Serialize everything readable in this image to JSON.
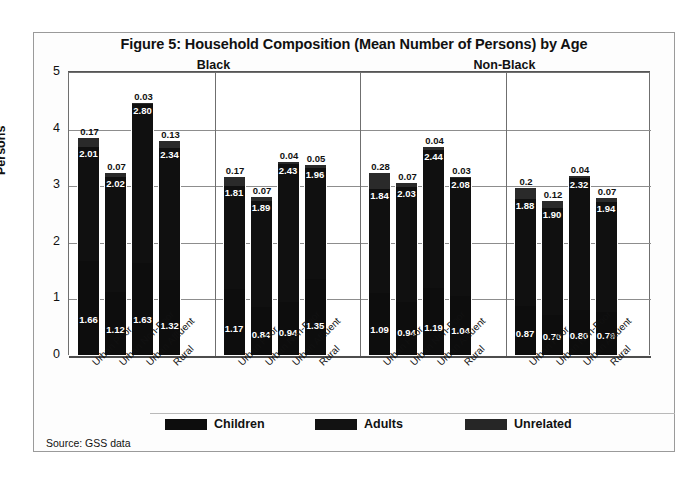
{
  "figure": {
    "title": "Figure 5: Household Composition (Mean Number of Persons) by Age",
    "source": "Source:  GSS data"
  },
  "axis": {
    "ylabel": "Persons",
    "yticks": [
      "0",
      "1",
      "2",
      "3",
      "4",
      "5"
    ],
    "ymin": 0,
    "ymax": 5
  },
  "legend": {
    "items": [
      {
        "label": "Children",
        "color": "#0d0d0d",
        "icon": "legend-swatch-icon"
      },
      {
        "label": "Adults",
        "color": "#121212",
        "icon": "legend-swatch-icon"
      },
      {
        "label": "Unrelated",
        "color": "#262626",
        "icon": "legend-swatch-icon"
      }
    ]
  },
  "superheaders": [
    {
      "label": "Black"
    },
    {
      "label": "Non-Black"
    }
  ],
  "panels": [
    {
      "label": "1970s"
    },
    {
      "label": "1980s"
    },
    {
      "label": "1970s"
    },
    {
      "label": "1980s"
    }
  ],
  "categories": [
    "Urban Poor",
    "Urban Non-Poor",
    "Urban Affluent",
    "Rural"
  ],
  "chart_data": {
    "type": "bar",
    "title": "Figure 5: Household Composition (Mean Number of Persons) by Age",
    "xlabel": "",
    "ylabel": "Persons",
    "ylim": [
      0,
      5
    ],
    "grid": true,
    "stacked": true,
    "legend_position": "bottom",
    "categories": [
      "Urban Poor",
      "Urban Non-Poor",
      "Urban Affluent",
      "Rural"
    ],
    "series": [
      {
        "name": "Children",
        "color": "#0d0d0d"
      },
      {
        "name": "Adults",
        "color": "#121212"
      },
      {
        "name": "Unrelated",
        "color": "#262626"
      }
    ],
    "groups": [
      {
        "race": "Black",
        "decade": "1970s",
        "bars": [
          {
            "category": "Urban Poor",
            "children": 1.66,
            "adults": 2.01,
            "unrelated": 0.17,
            "total": 3.84
          },
          {
            "category": "Urban Non-Poor",
            "children": 1.12,
            "adults": 2.02,
            "unrelated": 0.07,
            "total": 3.21
          },
          {
            "category": "Urban Affluent",
            "children": 1.63,
            "adults": 2.8,
            "unrelated": 0.03,
            "total": 4.46
          },
          {
            "category": "Rural",
            "children": 1.32,
            "adults": 2.34,
            "unrelated": 0.13,
            "total": 3.79
          }
        ]
      },
      {
        "race": "Black",
        "decade": "1980s",
        "bars": [
          {
            "category": "Urban Poor",
            "children": 1.17,
            "adults": 1.81,
            "unrelated": 0.17,
            "total": 3.15
          },
          {
            "category": "Urban Non-Poor",
            "children": 0.84,
            "adults": 1.89,
            "unrelated": 0.07,
            "total": 2.8
          },
          {
            "category": "Urban Affluent",
            "children": 0.94,
            "adults": 2.43,
            "unrelated": 0.04,
            "total": 3.41
          },
          {
            "category": "Rural",
            "children": 1.35,
            "adults": 1.96,
            "unrelated": 0.05,
            "total": 3.36
          }
        ]
      },
      {
        "race": "Non-Black",
        "decade": "1970s",
        "bars": [
          {
            "category": "Urban Poor",
            "children": 1.09,
            "adults": 1.84,
            "unrelated": 0.28,
            "total": 3.21
          },
          {
            "category": "Urban Non-Poor",
            "children": 0.94,
            "adults": 2.03,
            "unrelated": 0.07,
            "total": 3.04
          },
          {
            "category": "Urban Affluent",
            "children": 1.19,
            "adults": 2.44,
            "unrelated": 0.04,
            "total": 3.67
          },
          {
            "category": "Rural",
            "children": 1.04,
            "adults": 2.08,
            "unrelated": 0.03,
            "total": 3.15
          }
        ]
      },
      {
        "race": "Non-Black",
        "decade": "1980s",
        "bars": [
          {
            "category": "Urban Poor",
            "children": 0.87,
            "adults": 1.88,
            "unrelated": 0.2,
            "total": 2.95
          },
          {
            "category": "Urban Non-Poor",
            "children": 0.7,
            "adults": 1.9,
            "unrelated": 0.12,
            "total": 2.72
          },
          {
            "category": "Urban Affluent",
            "children": 0.8,
            "adults": 2.32,
            "unrelated": 0.04,
            "total": 3.16
          },
          {
            "category": "Rural",
            "children": 0.76,
            "adults": 1.94,
            "unrelated": 0.07,
            "total": 2.77
          }
        ]
      }
    ],
    "value_labels": {
      "children": [
        "1.66",
        "1.12",
        "1.63",
        "1.32",
        "1.17",
        "0.84",
        "0.94",
        "1.35",
        "1.09",
        "0.94",
        "1.19",
        "1.04",
        "0.87",
        "0.70",
        "0.80",
        "0.76"
      ],
      "adults": [
        "2.01",
        "2.02",
        "2.80",
        "2.34",
        "1.81",
        "1.89",
        "2.43",
        "1.96",
        "1.84",
        "2.03",
        "2.44",
        "2.08",
        "1.88",
        "1.90",
        "2.32",
        "1.94"
      ],
      "unrelated": [
        "0.17",
        "0.07",
        "0.03",
        "0.13",
        "0.17",
        "0.07",
        "0.04",
        "0.05",
        "0.28",
        "0.07",
        "0.04",
        "0.03",
        "0.2",
        "0.12",
        "0.04",
        "0.07"
      ]
    }
  }
}
